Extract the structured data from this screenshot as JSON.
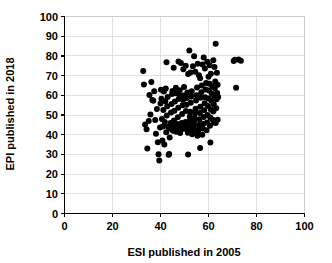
{
  "chart_data": {
    "type": "scatter",
    "title": "",
    "xlabel": "ESI published in 2005",
    "ylabel": "EPI published in 2018",
    "xlim": [
      0,
      100
    ],
    "ylim": [
      0,
      100
    ],
    "xticks": [
      0,
      20,
      40,
      60,
      80,
      100
    ],
    "yticks": [
      0,
      10,
      20,
      30,
      40,
      50,
      60,
      70,
      80,
      90,
      100
    ],
    "xtick_labels": [
      "0",
      "20",
      "40",
      "60",
      "80",
      "100"
    ],
    "ytick_labels": [
      "0",
      "10",
      "20",
      "30",
      "40",
      "50",
      "60",
      "70",
      "80",
      "90",
      "100"
    ],
    "grid": true,
    "grid_color": "#d9d9d9",
    "legend": null,
    "legend_position": "none",
    "marker_color": "#000000",
    "marker_shape": "circle",
    "marker_size": 3,
    "n_points": 171,
    "series": [
      {
        "name": "Countries",
        "points": [
          [
            32.8,
            72.3
          ],
          [
            33.1,
            65.5
          ],
          [
            33.6,
            45.2
          ],
          [
            34.2,
            42.8
          ],
          [
            34.5,
            33.0
          ],
          [
            35.1,
            46.9
          ],
          [
            35.4,
            60.1
          ],
          [
            35.8,
            50.2
          ],
          [
            36.2,
            66.8
          ],
          [
            36.6,
            57.6
          ],
          [
            37.0,
            57.2
          ],
          [
            37.4,
            62.1
          ],
          [
            37.8,
            47.4
          ],
          [
            38.1,
            40.5
          ],
          [
            38.5,
            53.0
          ],
          [
            38.9,
            36.2
          ],
          [
            39.2,
            30.1
          ],
          [
            39.5,
            26.9
          ],
          [
            39.8,
            43.6
          ],
          [
            40.0,
            55.8
          ],
          [
            40.2,
            62.8
          ],
          [
            40.4,
            58.3
          ],
          [
            40.6,
            48.0
          ],
          [
            40.8,
            37.1
          ],
          [
            41.0,
            44.2
          ],
          [
            41.2,
            52.6
          ],
          [
            41.4,
            61.9
          ],
          [
            41.6,
            35.0
          ],
          [
            41.8,
            46.5
          ],
          [
            42.0,
            57.0
          ],
          [
            42.2,
            63.4
          ],
          [
            42.4,
            41.2
          ],
          [
            42.6,
            49.8
          ],
          [
            42.8,
            54.4
          ],
          [
            43.0,
            59.2
          ],
          [
            43.2,
            44.0
          ],
          [
            43.4,
            29.8
          ],
          [
            43.6,
            30.2
          ],
          [
            43.8,
            38.6
          ],
          [
            44.0,
            43.1
          ],
          [
            44.2,
            45.9
          ],
          [
            44.4,
            51.3
          ],
          [
            44.6,
            55.6
          ],
          [
            44.8,
            60.7
          ],
          [
            45.0,
            62.2
          ],
          [
            45.2,
            42.0
          ],
          [
            45.4,
            44.6
          ],
          [
            45.6,
            47.2
          ],
          [
            45.8,
            52.1
          ],
          [
            46.0,
            56.9
          ],
          [
            46.2,
            61.0
          ],
          [
            46.4,
            63.8
          ],
          [
            46.6,
            41.5
          ],
          [
            46.8,
            43.8
          ],
          [
            47.0,
            45.4
          ],
          [
            47.2,
            48.8
          ],
          [
            47.4,
            53.7
          ],
          [
            47.6,
            58.1
          ],
          [
            47.8,
            60.4
          ],
          [
            48.0,
            62.6
          ],
          [
            48.2,
            40.8
          ],
          [
            48.4,
            42.4
          ],
          [
            48.6,
            44.1
          ],
          [
            48.8,
            46.0
          ],
          [
            49.0,
            50.5
          ],
          [
            49.2,
            54.9
          ],
          [
            49.4,
            57.8
          ],
          [
            49.6,
            59.9
          ],
          [
            49.8,
            64.2
          ],
          [
            50.0,
            43.0
          ],
          [
            50.2,
            44.8
          ],
          [
            50.4,
            46.4
          ],
          [
            50.6,
            52.0
          ],
          [
            50.8,
            55.2
          ],
          [
            51.0,
            58.6
          ],
          [
            51.2,
            61.4
          ],
          [
            51.4,
            41.0
          ],
          [
            51.6,
            42.9
          ],
          [
            51.8,
            44.4
          ],
          [
            52.0,
            47.0
          ],
          [
            52.2,
            49.2
          ],
          [
            52.4,
            51.6
          ],
          [
            52.6,
            56.2
          ],
          [
            52.8,
            59.4
          ],
          [
            53.0,
            62.0
          ],
          [
            53.2,
            40.2
          ],
          [
            53.4,
            41.9
          ],
          [
            53.6,
            43.5
          ],
          [
            53.8,
            45.0
          ],
          [
            54.0,
            46.8
          ],
          [
            54.2,
            48.4
          ],
          [
            54.4,
            50.8
          ],
          [
            54.6,
            53.2
          ],
          [
            54.8,
            57.4
          ],
          [
            55.0,
            60.0
          ],
          [
            55.2,
            64.0
          ],
          [
            55.4,
            39.5
          ],
          [
            55.6,
            41.4
          ],
          [
            55.8,
            42.6
          ],
          [
            56.0,
            44.9
          ],
          [
            56.2,
            47.8
          ],
          [
            56.4,
            51.0
          ],
          [
            56.6,
            54.2
          ],
          [
            56.8,
            58.8
          ],
          [
            57.0,
            61.6
          ],
          [
            57.2,
            65.0
          ],
          [
            57.4,
            40.0
          ],
          [
            57.6,
            43.2
          ],
          [
            57.8,
            45.6
          ],
          [
            58.0,
            49.0
          ],
          [
            58.2,
            52.4
          ],
          [
            58.4,
            56.0
          ],
          [
            58.6,
            59.0
          ],
          [
            58.8,
            63.0
          ],
          [
            59.0,
            66.2
          ],
          [
            59.2,
            42.2
          ],
          [
            59.4,
            46.2
          ],
          [
            59.6,
            50.0
          ],
          [
            59.8,
            54.6
          ],
          [
            60.0,
            58.4
          ],
          [
            60.2,
            62.4
          ],
          [
            60.4,
            65.8
          ],
          [
            60.6,
            44.5
          ],
          [
            60.8,
            48.6
          ],
          [
            61.0,
            52.8
          ],
          [
            61.2,
            57.2
          ],
          [
            61.4,
            60.8
          ],
          [
            61.6,
            64.6
          ],
          [
            61.8,
            47.6
          ],
          [
            62.0,
            51.8
          ],
          [
            62.2,
            55.4
          ],
          [
            62.4,
            59.6
          ],
          [
            62.6,
            63.6
          ],
          [
            62.8,
            67.0
          ],
          [
            63.0,
            46.0
          ],
          [
            63.2,
            53.4
          ],
          [
            63.4,
            58.0
          ],
          [
            63.6,
            61.2
          ],
          [
            63.8,
            65.4
          ],
          [
            64.0,
            59.2
          ],
          [
            42.5,
            76.8
          ],
          [
            45.5,
            74.0
          ],
          [
            47.5,
            77.2
          ],
          [
            48.5,
            76.4
          ],
          [
            49.5,
            73.2
          ],
          [
            50.5,
            75.0
          ],
          [
            51.5,
            70.8
          ],
          [
            52.0,
            82.8
          ],
          [
            52.5,
            71.6
          ],
          [
            53.5,
            74.8
          ],
          [
            54.0,
            79.8
          ],
          [
            54.5,
            72.0
          ],
          [
            55.5,
            76.0
          ],
          [
            56.0,
            70.2
          ],
          [
            56.5,
            68.6
          ],
          [
            57.5,
            75.6
          ],
          [
            58.0,
            79.2
          ],
          [
            58.5,
            73.6
          ],
          [
            59.5,
            77.0
          ],
          [
            60.0,
            69.4
          ],
          [
            60.5,
            75.2
          ],
          [
            61.0,
            71.0
          ],
          [
            62.0,
            77.8
          ],
          [
            62.5,
            74.4
          ],
          [
            63.0,
            86.2
          ],
          [
            63.5,
            71.4
          ],
          [
            70.5,
            77.4
          ],
          [
            71.0,
            78.0
          ],
          [
            72.5,
            78.2
          ],
          [
            73.5,
            77.6
          ],
          [
            71.5,
            63.8
          ],
          [
            63.8,
            47.6
          ],
          [
            62.2,
            46.2
          ],
          [
            60.8,
            36.0
          ],
          [
            56.5,
            33.2
          ],
          [
            51.5,
            30.0
          ]
        ]
      }
    ]
  },
  "axes": {
    "x": {
      "label": "ESI published in 2005",
      "labels": [
        "0",
        "20",
        "40",
        "60",
        "80",
        "100"
      ]
    },
    "y": {
      "label": "EPI published in 2018",
      "labels": [
        "100",
        "90",
        "80",
        "70",
        "60",
        "50",
        "40",
        "30",
        "20",
        "10",
        "0"
      ]
    }
  }
}
